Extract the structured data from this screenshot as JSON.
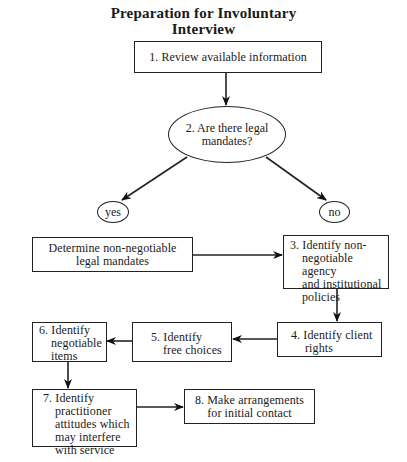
{
  "title": {
    "line1": "Preparation for Involuntary",
    "line2": "Interview"
  },
  "nodes": {
    "step1": {
      "label": "1. Review available information"
    },
    "step2": {
      "line1": "2. Are there legal",
      "line2": "mandates?"
    },
    "yes": {
      "label": "yes"
    },
    "no": {
      "label": "no"
    },
    "determine": {
      "line1": "Determine non-negotiable",
      "line2": "legal mandates"
    },
    "step3": {
      "line1": "3. Identify non-",
      "line2": "negotiable agency",
      "line3": "and institutional",
      "line4": "policies"
    },
    "step4": {
      "line1": "4. Identify client",
      "line2": "rights"
    },
    "step5": {
      "line1": "5. Identify",
      "line2": "free choices"
    },
    "step6": {
      "line1": "6. Identify",
      "line2": "negotiable",
      "line3": "items"
    },
    "step7": {
      "line1": "7. Identify",
      "line2": "practitioner",
      "line3": "attitudes which",
      "line4": "may interfere",
      "line5": "with service"
    },
    "step8": {
      "line1": "8. Make arrangements",
      "line2": "for initial contact"
    }
  },
  "edges": [
    {
      "from": "step1",
      "to": "step2"
    },
    {
      "from": "step2",
      "to": "yes"
    },
    {
      "from": "step2",
      "to": "no"
    },
    {
      "from": "determine",
      "to": "step3"
    },
    {
      "from": "step3",
      "to": "step4"
    },
    {
      "from": "step4",
      "to": "step5"
    },
    {
      "from": "step5",
      "to": "step6"
    },
    {
      "from": "step6",
      "to": "step7"
    },
    {
      "from": "step7",
      "to": "step8"
    }
  ],
  "colors": {
    "stroke": "#222222",
    "background": "#ffffff",
    "text": "#1a1a1a"
  }
}
